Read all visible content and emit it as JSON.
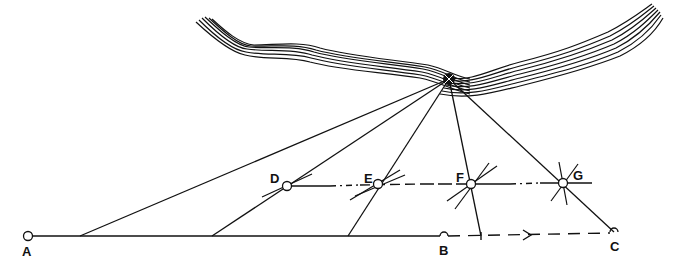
{
  "diagram": {
    "type": "survey-triangulation",
    "colors": {
      "ink": "#111111",
      "background": "#ffffff"
    },
    "summit": {
      "name": "summit-target",
      "x": 449,
      "y": 79
    },
    "baseline": {
      "points": [
        {
          "id": "A",
          "label": "A",
          "x": 28,
          "y": 236
        },
        {
          "id": "B",
          "label": "B",
          "x": 444,
          "y": 236
        },
        {
          "id": "C",
          "label": "C",
          "x": 614,
          "y": 232
        }
      ],
      "arrow_x": 530
    },
    "traverse": {
      "y": 185,
      "stations": [
        {
          "id": "D",
          "label": "D",
          "x": 287,
          "y": 186
        },
        {
          "id": "E",
          "label": "E",
          "x": 378,
          "y": 184
        },
        {
          "id": "F",
          "label": "F",
          "x": 471,
          "y": 184
        },
        {
          "id": "G",
          "label": "G",
          "x": 563,
          "y": 183
        }
      ]
    },
    "sight_lines_to_baseline": [
      80,
      212,
      348,
      481,
      614
    ]
  },
  "labels": {
    "A": "A",
    "B": "B",
    "C": "C",
    "D": "D",
    "E": "E",
    "F": "F",
    "G": "G"
  }
}
